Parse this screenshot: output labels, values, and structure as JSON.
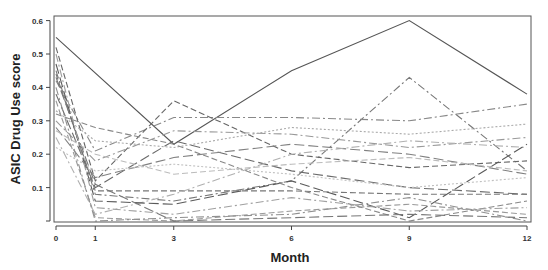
{
  "chart_data": {
    "type": "line",
    "title": "",
    "xlabel": "Month",
    "ylabel": "ASIC Drug Use score",
    "x": [
      0,
      1,
      3,
      6,
      9,
      12
    ],
    "x_tick_labels": [
      "0",
      "1",
      "3",
      "6",
      "9",
      "12"
    ],
    "y_tick_labels": [
      "0.1",
      "0.2",
      "0.3",
      "0.4",
      "0.5",
      "0.6"
    ],
    "y_ticks": [
      0.0,
      0.1,
      0.2,
      0.3,
      0.4,
      0.5,
      0.6
    ],
    "xlim": [
      0,
      12
    ],
    "ylim": [
      0,
      0.6
    ],
    "grid": false,
    "legend": "none",
    "note": "Spaghetti plot of individual subject trajectories; values estimated from pixels",
    "series": [
      {
        "name": "S1",
        "style": "solid",
        "color": "#555555",
        "points": [
          [
            0,
            0.55
          ],
          [
            3,
            0.23
          ],
          [
            6,
            0.45
          ],
          [
            9,
            0.6
          ],
          [
            12,
            0.38
          ]
        ]
      },
      {
        "name": "S2",
        "style": "dashdot",
        "color": "#777777",
        "points": [
          [
            0,
            0.45
          ],
          [
            1,
            0.08
          ],
          [
            3,
            0.06
          ],
          [
            6,
            0.12
          ],
          [
            9,
            0.43
          ],
          [
            12,
            0.15
          ]
        ]
      },
      {
        "name": "S3",
        "style": "dashdot",
        "color": "#888888",
        "points": [
          [
            0,
            0.42
          ],
          [
            1,
            0.21
          ],
          [
            3,
            0.31
          ],
          [
            6,
            0.31
          ],
          [
            9,
            0.3
          ],
          [
            12,
            0.35
          ]
        ]
      },
      {
        "name": "S4",
        "style": "dashed",
        "color": "#666666",
        "points": [
          [
            0,
            0.52
          ],
          [
            1,
            0.12
          ],
          [
            3,
            0.36
          ],
          [
            6,
            0.2
          ],
          [
            9,
            0.16
          ],
          [
            12,
            0.18
          ]
        ]
      },
      {
        "name": "S5",
        "style": "longdash",
        "color": "#6a6a6a",
        "points": [
          [
            0,
            0.38
          ],
          [
            1,
            0.1
          ],
          [
            3,
            0.24
          ],
          [
            6,
            0.15
          ],
          [
            9,
            0.1
          ],
          [
            12,
            0.08
          ]
        ]
      },
      {
        "name": "S6",
        "style": "dotted",
        "color": "#aaaaaa",
        "points": [
          [
            0,
            0.33
          ],
          [
            1,
            0.24
          ],
          [
            3,
            0.22
          ],
          [
            6,
            0.28
          ],
          [
            9,
            0.26
          ],
          [
            12,
            0.29
          ]
        ]
      },
      {
        "name": "S7",
        "style": "dashdot",
        "color": "#999999",
        "points": [
          [
            0,
            0.3
          ],
          [
            1,
            0.18
          ],
          [
            3,
            0.27
          ],
          [
            6,
            0.26
          ],
          [
            9,
            0.22
          ],
          [
            12,
            0.25
          ]
        ]
      },
      {
        "name": "S8",
        "style": "dashed",
        "color": "#777777",
        "points": [
          [
            0,
            0.44
          ],
          [
            1,
            0.09
          ],
          [
            3,
            0.09
          ],
          [
            6,
            0.09
          ],
          [
            9,
            0.08
          ],
          [
            12,
            0.08
          ]
        ]
      },
      {
        "name": "S9",
        "style": "longdash",
        "color": "#808080",
        "points": [
          [
            0,
            0.28
          ],
          [
            1,
            0.13
          ],
          [
            3,
            0.19
          ],
          [
            6,
            0.23
          ],
          [
            9,
            0.2
          ],
          [
            12,
            0.14
          ]
        ]
      },
      {
        "name": "S10",
        "style": "dashdot",
        "color": "#b0b0b0",
        "points": [
          [
            0,
            0.25
          ],
          [
            1,
            0.02
          ],
          [
            3,
            0.08
          ],
          [
            6,
            0.2
          ],
          [
            9,
            0.24
          ],
          [
            12,
            0.22
          ]
        ]
      },
      {
        "name": "S11",
        "style": "dashed",
        "color": "#999999",
        "points": [
          [
            0,
            0.36
          ],
          [
            1,
            0.01
          ],
          [
            3,
            0.0
          ],
          [
            6,
            0.03
          ],
          [
            9,
            0.05
          ],
          [
            12,
            0.02
          ]
        ]
      },
      {
        "name": "S12",
        "style": "longdash",
        "color": "#5a5a5a",
        "points": [
          [
            0,
            0.47
          ],
          [
            1,
            0.06
          ],
          [
            3,
            0.05
          ],
          [
            6,
            0.12
          ],
          [
            9,
            0.01
          ],
          [
            12,
            0.23
          ]
        ]
      },
      {
        "name": "S13",
        "style": "dashdot",
        "color": "#909090",
        "points": [
          [
            0,
            0.4
          ],
          [
            1,
            0.0
          ],
          [
            3,
            0.01
          ],
          [
            6,
            0.02
          ],
          [
            9,
            0.07
          ],
          [
            12,
            0.0
          ]
        ]
      },
      {
        "name": "S14",
        "style": "dotted",
        "color": "#c0c0c0",
        "points": [
          [
            0,
            0.22
          ],
          [
            1,
            0.15
          ],
          [
            3,
            0.17
          ],
          [
            6,
            0.14
          ],
          [
            9,
            0.1
          ],
          [
            12,
            0.13
          ]
        ]
      },
      {
        "name": "S15",
        "style": "dashed",
        "color": "#888888",
        "points": [
          [
            0,
            0.32
          ],
          [
            1,
            0.28
          ],
          [
            3,
            0.23
          ],
          [
            6,
            0.1
          ],
          [
            9,
            0.0
          ],
          [
            12,
            0.06
          ]
        ]
      },
      {
        "name": "S16",
        "style": "longdash",
        "color": "#777777",
        "points": [
          [
            0,
            0.43
          ],
          [
            1,
            0.11
          ],
          [
            3,
            0.0
          ],
          [
            6,
            0.01
          ],
          [
            9,
            0.02
          ],
          [
            12,
            0.01
          ]
        ]
      },
      {
        "name": "S17",
        "style": "dashdot",
        "color": "#a0a0a0",
        "points": [
          [
            0,
            0.5
          ],
          [
            1,
            0.04
          ],
          [
            3,
            0.02
          ],
          [
            6,
            0.07
          ],
          [
            9,
            0.03
          ],
          [
            12,
            0.04
          ]
        ]
      },
      {
        "name": "S18",
        "style": "dashed",
        "color": "#bbbbbb",
        "points": [
          [
            0,
            0.27
          ],
          [
            1,
            0.2
          ],
          [
            3,
            0.14
          ],
          [
            6,
            0.17
          ],
          [
            9,
            0.19
          ],
          [
            12,
            0.15
          ]
        ]
      }
    ]
  }
}
